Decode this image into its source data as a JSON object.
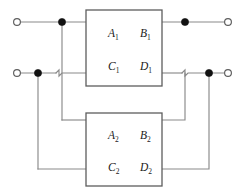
{
  "diagram": {
    "type": "circuit-schematic",
    "canvas": {
      "width": 246,
      "height": 195,
      "background": "#ffffff"
    },
    "colors": {
      "wire": "#8a8a8a",
      "box_border": "#5d5d5d",
      "node_filled": "#111111",
      "node_open_fill": "#ffffff",
      "text": "#1a1a1a"
    },
    "blocks": [
      {
        "id": "network-1",
        "x": 86,
        "y": 10,
        "width": 76,
        "height": 76,
        "parameters": [
          {
            "name": "A1",
            "base": "A",
            "sub": "1",
            "x": 108,
            "y": 37
          },
          {
            "name": "B1",
            "base": "B",
            "sub": "1",
            "x": 140,
            "y": 37
          },
          {
            "name": "C1",
            "base": "C",
            "sub": "1",
            "x": 108,
            "y": 70
          },
          {
            "name": "D1",
            "base": "D",
            "sub": "1",
            "x": 140,
            "y": 70
          }
        ]
      },
      {
        "id": "network-2",
        "x": 86,
        "y": 113,
        "width": 76,
        "height": 73,
        "parameters": [
          {
            "name": "A2",
            "base": "A",
            "sub": "2",
            "x": 108,
            "y": 139
          },
          {
            "name": "B2",
            "base": "B",
            "sub": "2",
            "x": 140,
            "y": 139
          },
          {
            "name": "C2",
            "base": "C",
            "sub": "2",
            "x": 108,
            "y": 171
          },
          {
            "name": "D2",
            "base": "D",
            "sub": "2",
            "x": 140,
            "y": 171
          }
        ]
      }
    ],
    "terminals": [
      {
        "id": "input-top",
        "style": "open",
        "cx": 17,
        "cy": 22,
        "r": 3.4
      },
      {
        "id": "input-bottom",
        "style": "open",
        "cx": 17,
        "cy": 73,
        "r": 3.4
      },
      {
        "id": "output-top",
        "style": "open",
        "cx": 228,
        "cy": 22,
        "r": 3.4
      },
      {
        "id": "output-bottom",
        "style": "open",
        "cx": 228,
        "cy": 73,
        "r": 3.4
      }
    ],
    "junctions": [
      {
        "id": "junction-input-top",
        "cx": 62,
        "cy": 22,
        "r": 3.6
      },
      {
        "id": "junction-input-bottom",
        "cx": 38,
        "cy": 73,
        "r": 3.6
      },
      {
        "id": "junction-output-top",
        "cx": 185,
        "cy": 22,
        "r": 3.6
      },
      {
        "id": "junction-output-bottom",
        "cx": 209,
        "cy": 73,
        "r": 3.6
      }
    ],
    "wires": [
      {
        "id": "wire-in-top-lead",
        "d": "M 20.4 22 L 86 22"
      },
      {
        "id": "wire-in-bottom-lead",
        "d": "M 20.4 73 L 56 73"
      },
      {
        "id": "wire-in-bottom-hop",
        "d": "M 56 73 L 59 70 L 59 76 L 62 73 L 86 73"
      },
      {
        "id": "wire-top-tap-down",
        "d": "M 62 22 L 62 120"
      },
      {
        "id": "wire-top-tap-to-box2",
        "d": "M 62 120 L 86 120"
      },
      {
        "id": "wire-bottom-tap-down",
        "d": "M 38 73 L 38 169"
      },
      {
        "id": "wire-bottom-tap-right",
        "d": "M 38 169 L 86 169"
      },
      {
        "id": "wire-out-top-lead",
        "d": "M 162 22 L 224.6 22"
      },
      {
        "id": "wire-out-bottom-lead",
        "d": "M 162 73 L 182 73"
      },
      {
        "id": "wire-out-bottom-hop",
        "d": "M 182 73 L 185 70 L 185 76 L 188 73 L 224.6 73"
      },
      {
        "id": "wire-box2-top-right",
        "d": "M 162 120 L 185 120 L 185 73"
      },
      {
        "id": "wire-box2-bottom-right",
        "d": "M 162 169 L 209 169 L 209 73"
      }
    ]
  }
}
